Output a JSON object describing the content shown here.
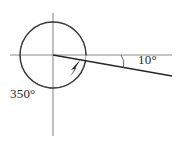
{
  "figure": {
    "type": "angle-diagram",
    "background_color": "#ffffff",
    "axis_color": "#8c8c8c",
    "circle_color": "#8c8c8c",
    "ray_color": "#262626",
    "arc_color": "#3d3d3d",
    "label_color": "#262626",
    "origin": {
      "x": 53,
      "y": 55
    },
    "circle_radius": 33,
    "axes": {
      "horizontal": {
        "x1": 10,
        "y1": 55,
        "x2": 172,
        "y2": 55
      },
      "vertical": {
        "x1": 53,
        "y1": 13,
        "x2": 53,
        "y2": 136
      }
    },
    "terminal_ray": {
      "from": {
        "x": 53,
        "y": 55
      },
      "to": {
        "x": 172,
        "y": 76
      },
      "angle_degrees": -10
    },
    "sweep_arc": {
      "direction": "clockwise",
      "start_angle_degrees": 0,
      "end_angle_degrees": -350,
      "arrow": "arrowhead-at-end"
    },
    "labels": {
      "negative_sweep": "350°",
      "small_angle": "10°"
    }
  }
}
